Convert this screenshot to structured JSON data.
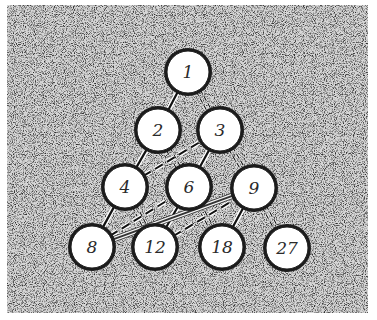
{
  "diagram": {
    "title": "",
    "background": {
      "color_dark": "#3a3a3a",
      "color_light": "#d8d8d8",
      "x": 7,
      "y": 5,
      "width": 361,
      "height": 308
    },
    "node_radius": 21,
    "node_fill": "#ffffff",
    "node_stroke": "#1a1a1a",
    "nodes": [
      {
        "id": "n1",
        "label": "1",
        "x": 188,
        "y": 72
      },
      {
        "id": "n2",
        "label": "2",
        "x": 158,
        "y": 130
      },
      {
        "id": "n3",
        "label": "3",
        "x": 220,
        "y": 130
      },
      {
        "id": "n4",
        "label": "4",
        "x": 125,
        "y": 187
      },
      {
        "id": "n6",
        "label": "6",
        "x": 189,
        "y": 187
      },
      {
        "id": "n9",
        "label": "9",
        "x": 254,
        "y": 188
      },
      {
        "id": "n8",
        "label": "8",
        "x": 92,
        "y": 247
      },
      {
        "id": "n12",
        "label": "12",
        "x": 155,
        "y": 247
      },
      {
        "id": "n18",
        "label": "18",
        "x": 222,
        "y": 247
      },
      {
        "id": "n27",
        "label": "27",
        "x": 287,
        "y": 248
      }
    ],
    "edges": [
      {
        "from": "n1",
        "to": "n2",
        "style": "solid"
      },
      {
        "from": "n2",
        "to": "n4",
        "style": "solid"
      },
      {
        "from": "n3",
        "to": "n6",
        "style": "solid"
      },
      {
        "from": "n4",
        "to": "n8",
        "style": "solid"
      },
      {
        "from": "n6",
        "to": "n12",
        "style": "solid"
      },
      {
        "from": "n9",
        "to": "n18",
        "style": "solid"
      },
      {
        "from": "n1",
        "to": "n3",
        "style": "double-dash"
      },
      {
        "from": "n2",
        "to": "n6",
        "style": "double-dash"
      },
      {
        "from": "n3",
        "to": "n9",
        "style": "double-dash"
      },
      {
        "from": "n4",
        "to": "n12",
        "style": "double-dash"
      },
      {
        "from": "n6",
        "to": "n18",
        "style": "double-dash"
      },
      {
        "from": "n9",
        "to": "n27",
        "style": "double-dash"
      },
      {
        "from": "n4",
        "to": "n3",
        "style": "dashed"
      },
      {
        "from": "n8",
        "to": "n6",
        "style": "dashed"
      },
      {
        "from": "n12",
        "to": "n9",
        "style": "dashed"
      },
      {
        "from": "n8",
        "to": "n9",
        "style": "white-double"
      }
    ]
  }
}
